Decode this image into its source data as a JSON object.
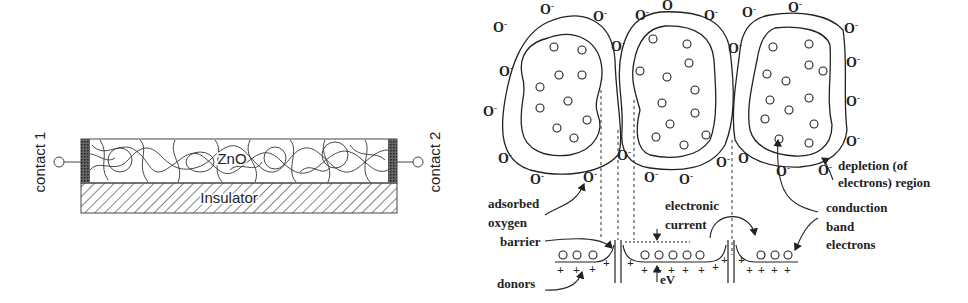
{
  "left_panel": {
    "film_label": "ZnO",
    "substrate_label": "Insulator",
    "contact_left": "contact 1",
    "contact_right": "contact 2"
  },
  "right_panel": {
    "adsorbed_species": "O",
    "adsorbed_charge": "-",
    "labels": {
      "adsorbed_oxygen_line1": "adsorbed",
      "adsorbed_oxygen_line2": "oxygen",
      "barrier": "barrier",
      "donors": "donors",
      "electronic_current_line1": "electronic",
      "electronic_current_line2": "current",
      "eV": "eV",
      "depletion_line1": "depletion (of",
      "depletion_line2": "electrons) region",
      "conduction_line1": "conduction",
      "conduction_line2": "band",
      "conduction_line3": "electrons"
    },
    "donor_symbol": "+"
  },
  "colors": {
    "ink": "#222222",
    "contact_fill": "#555555",
    "background": "#ffffff"
  }
}
